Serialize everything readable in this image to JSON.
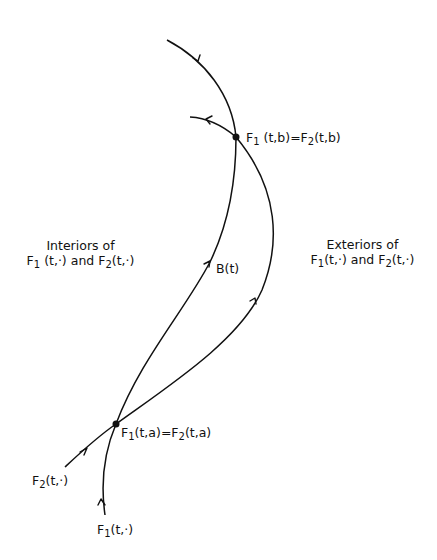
{
  "diagram": {
    "type": "trajectory-diagram",
    "colors": {
      "stroke": "#111111",
      "background": "#ffffff"
    },
    "points": {
      "top_intersection": {
        "label_lhs_base": "F",
        "label_lhs_sub": "1",
        "label_lhs_args": "(t,b)",
        "equals": "=",
        "label_rhs_base": "F",
        "label_rhs_sub": "2",
        "label_rhs_args": "(t,b)",
        "x": 236,
        "y": 137
      },
      "bottom_intersection": {
        "label_lhs_base": "F",
        "label_lhs_sub": "1",
        "label_lhs_args": "(t,a)",
        "equals": "=",
        "label_rhs_base": "F",
        "label_rhs_sub": "2",
        "label_rhs_args": "(t,a)",
        "x": 116,
        "y": 424
      }
    },
    "curves": [
      {
        "name": "F1",
        "description": "enters from bottom, passes through F1(t,a), follows B(t) up to F1(t,b), exits top-left"
      },
      {
        "name": "F2",
        "description": "enters from lower-left, passes through F2(t,a), bows right, through F2(t,b), exits left"
      }
    ],
    "labels": {
      "interiors": {
        "line1": "Interiors of",
        "f1_base": "F",
        "f1_sub": "1",
        "f1_args": " (t,·)",
        "and": " and ",
        "f2_base": "F",
        "f2_sub": "2",
        "f2_args": "(t,·)"
      },
      "exteriors": {
        "line1": "Exteriors of",
        "f1_base": "F",
        "f1_sub": "1",
        "f1_args": "(t,·)",
        "and": " and ",
        "f2_base": "F",
        "f2_sub": "2",
        "f2_args": "(t,·)"
      },
      "boundary": "B(t)",
      "f2_start": {
        "base": "F",
        "sub": "2",
        "args": "(t,·)"
      },
      "f1_start": {
        "base": "F",
        "sub": "1",
        "args": "(t,·)"
      }
    }
  }
}
